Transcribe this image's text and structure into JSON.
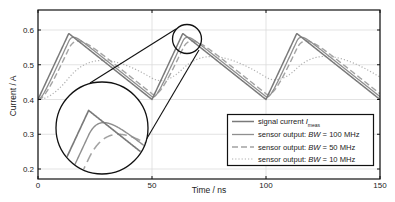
{
  "chart_data": {
    "type": "line",
    "title": "",
    "xlabel": "Time / ns",
    "ylabel": "Current / A",
    "xlim": [
      0,
      150
    ],
    "ylim": [
      0.2,
      0.66
    ],
    "xticks": [
      0,
      50,
      100,
      150
    ],
    "xtick_labels": [
      "0",
      "50",
      "100",
      "150"
    ],
    "yticks": [
      0.2,
      0.3,
      0.4,
      0.5,
      0.6
    ],
    "ytick_labels": [
      "0.2",
      "0.3",
      "0.4",
      "0.5",
      "0.6"
    ],
    "grid": true,
    "legend_position": "lower right",
    "signal": {
      "period_ns": 50,
      "rise_ns": 13.5,
      "low_A": 0.4,
      "high_A": 0.59,
      "start_ns": 0
    },
    "series": [
      {
        "name": "signal current I_meas",
        "label_main": "signal current ",
        "label_italic": "I",
        "label_sub": "meas",
        "bandwidth_MHz": null,
        "color": "#7a7a7a",
        "width": 1.5,
        "dash": ""
      },
      {
        "name": "sensor output: BW = 100 MHz",
        "label_main": "sensor output: ",
        "label_italic": "BW",
        "label_rest": " = 100 MHz",
        "bandwidth_MHz": 100,
        "color": "#8f8f8f",
        "width": 1.3,
        "dash": ""
      },
      {
        "name": "sensor output: BW = 50 MHz",
        "label_main": "sensor output: ",
        "label_italic": "BW",
        "label_rest": " = 50 MHz",
        "bandwidth_MHz": 50,
        "color": "#a3a3a3",
        "width": 1.4,
        "dash": "6,3"
      },
      {
        "name": "sensor output: BW = 10 MHz",
        "label_main": "sensor output: ",
        "label_italic": "BW",
        "label_rest": " = 10 MHz",
        "bandwidth_MHz": 10,
        "color": "#b0b0b0",
        "width": 1.2,
        "dash": "1.2,2"
      }
    ],
    "sample_points": {
      "signal_current": {
        "x": [
          0,
          13.5,
          50,
          63.5,
          100,
          113.5,
          150
        ],
        "y": [
          0.4,
          0.59,
          0.4,
          0.59,
          0.4,
          0.59,
          0.4
        ]
      },
      "bw_10MHz_approx": {
        "x": [
          0,
          20,
          35,
          53,
          70,
          85,
          103,
          120,
          135,
          150
        ],
        "y": [
          0.4,
          0.49,
          0.51,
          0.445,
          0.495,
          0.51,
          0.445,
          0.495,
          0.51,
          0.46
        ]
      }
    },
    "annotations": [
      {
        "type": "zoom-circle-source",
        "center_ns": 65,
        "center_A": 0.575,
        "radius_px": 15
      },
      {
        "type": "zoom-circle-magnified",
        "center_px": [
          102,
          128
        ],
        "radius_px": 46
      }
    ]
  },
  "plot_px": {
    "left": 38,
    "right": 380,
    "top": 10,
    "bottom": 179,
    "y_at_0_2": 169
  }
}
